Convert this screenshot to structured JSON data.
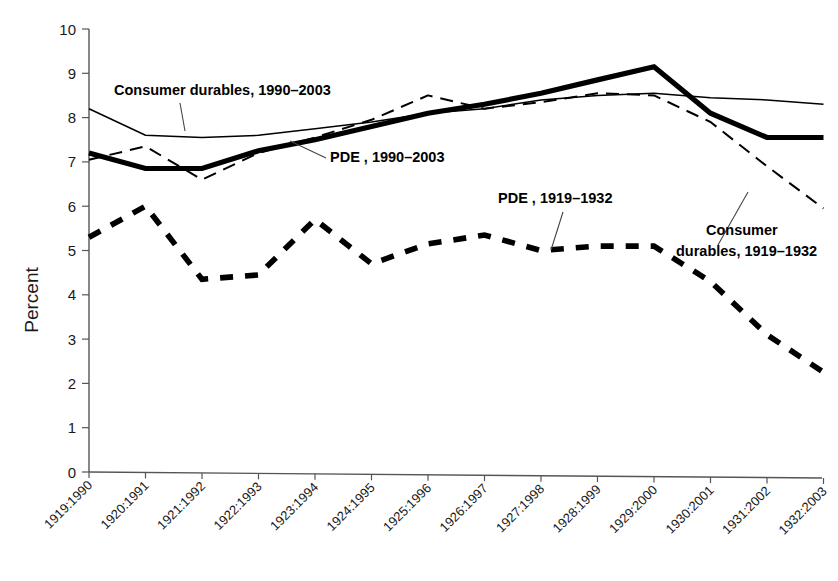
{
  "chart_data": {
    "type": "line",
    "title": "",
    "xlabel": "",
    "ylabel": "Percent",
    "ylim": [
      0,
      10
    ],
    "ytick_values": [
      0,
      1,
      2,
      3,
      4,
      5,
      6,
      7,
      8,
      9,
      10
    ],
    "grid": false,
    "legend_position": "inline-annotations",
    "categories": [
      "1919:1990",
      "1920:1991",
      "1921:1992",
      "1922:1993",
      "1923:1994",
      "1924:1995",
      "1925:1996",
      "1926:1997",
      "1927:1998",
      "1928:1999",
      "1929:2000",
      "1930:2001",
      "1931:2002",
      "1932:2003"
    ],
    "series": [
      {
        "name": "PDE , 1990-2003",
        "label": "PDE , 1990–2003",
        "style": "thick-solid",
        "values": [
          7.2,
          6.85,
          6.85,
          7.25,
          7.5,
          7.8,
          8.1,
          8.3,
          8.55,
          8.85,
          9.15,
          8.1,
          7.55,
          7.55
        ]
      },
      {
        "name": "Consumer durables, 1990-2003",
        "label": "Consumer durables, 1990–2003",
        "style": "thin-solid",
        "values": [
          8.2,
          7.6,
          7.55,
          7.6,
          7.75,
          7.9,
          8.1,
          8.2,
          8.4,
          8.5,
          8.55,
          8.45,
          8.4,
          8.3
        ]
      },
      {
        "name": "Consumer durables, 1919-1932",
        "label": "Consumer durables, 1919–1932",
        "style": "thin-dashed",
        "values": [
          7.05,
          7.35,
          6.6,
          7.2,
          7.55,
          7.95,
          8.5,
          8.2,
          8.35,
          8.55,
          8.5,
          7.9,
          6.9,
          5.95
        ]
      },
      {
        "name": "PDE , 1919-1932",
        "label": "PDE , 1919–1932",
        "style": "thick-dashed",
        "values": [
          5.3,
          6.0,
          4.35,
          4.45,
          5.7,
          4.7,
          5.15,
          5.35,
          5.0,
          5.1,
          5.1,
          4.3,
          3.1,
          2.25
        ]
      }
    ],
    "annotations": [
      {
        "id": "annot-consumer-durables-1990",
        "text": "Consumer durables, 1990–2003",
        "x": 114,
        "y": 95,
        "anchor": "start",
        "leader": [
          [
            180,
            103
          ],
          [
            185,
            131
          ]
        ]
      },
      {
        "id": "annot-pde-1990",
        "text": "PDE , 1990–2003",
        "x": 330,
        "y": 162,
        "anchor": "start",
        "leader": [
          [
            326,
            158
          ],
          [
            290,
            141
          ]
        ]
      },
      {
        "id": "annot-pde-1919",
        "text": "PDE , 1919–1932",
        "x": 498,
        "y": 203,
        "anchor": "start",
        "leader": [
          [
            563,
            212
          ],
          [
            551,
            250
          ]
        ]
      },
      {
        "id": "annot-consumer-durables-1919",
        "text": "Consumer",
        "text2": "durables, 1919–1932",
        "x": 706,
        "y": 235,
        "anchor": "start",
        "leader": [
          [
            718,
            245
          ],
          [
            748,
            192
          ]
        ]
      }
    ]
  },
  "axes": {
    "y_title": "Percent"
  }
}
